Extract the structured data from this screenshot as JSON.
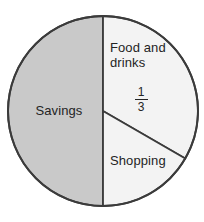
{
  "chart_data": {
    "type": "pie",
    "title": "",
    "subtitle": "",
    "xlabel": "",
    "ylabel": "",
    "legend_position": "none",
    "grid": false,
    "labels_inside_slices": true,
    "categories": [
      "Savings",
      "Food and drinks",
      "Shopping"
    ],
    "values": [
      50,
      33.3,
      16.7
    ],
    "value_unit": "percent of whole",
    "slices": [
      {
        "label": "Savings",
        "value": 50,
        "fraction": "1/2",
        "start_angle_deg": 90,
        "end_angle_deg": 270,
        "fill": "#c9c9c9",
        "stroke": "#3b3b3b",
        "data_label": ""
      },
      {
        "label": "Food and drinks",
        "value": 33.3,
        "fraction": "1/3",
        "start_angle_deg": -90,
        "end_angle_deg": 30,
        "fill": "#f3f3f3",
        "stroke": "#3b3b3b",
        "data_label": "1/3",
        "data_label_numerator": "1",
        "data_label_denominator": "3"
      },
      {
        "label": "Shopping",
        "value": 16.7,
        "fraction": "1/6",
        "start_angle_deg": 30,
        "end_angle_deg": 90,
        "fill": "#f3f3f3",
        "stroke": "#3b3b3b",
        "data_label": ""
      }
    ]
  },
  "figure": {
    "background": "#ffffff",
    "outline_color": "#3b3b3b",
    "text_color": "#242424",
    "savings_fill": "#c9c9c9",
    "light_fill": "#f3f3f3"
  },
  "labels": {
    "savings": "Savings",
    "food_and_drinks": "Food and\ndrinks",
    "shopping": "Shopping",
    "food_fraction_numerator": "1",
    "food_fraction_denominator": "3"
  }
}
